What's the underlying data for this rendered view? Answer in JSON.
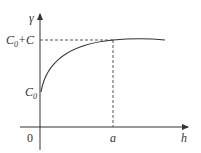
{
  "diagram": {
    "y_axis_label": "γ",
    "x_axis_label": "h",
    "origin_label": "0",
    "c0_label": "C",
    "c0_sub": "0",
    "sill_label_prefix": "C",
    "sill_label_sub": "0",
    "sill_label_suffix": "+C",
    "range_label": "a",
    "curve": "spherical-semivariogram",
    "colors": {
      "line": "#333333",
      "dashed": "#555555"
    }
  }
}
